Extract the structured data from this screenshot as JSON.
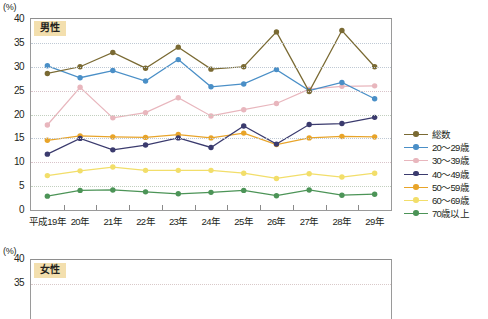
{
  "axis": {
    "unit_label": "(%)",
    "y_ticks": [
      "40",
      "35",
      "30",
      "25",
      "20",
      "15",
      "10",
      "5",
      "0"
    ],
    "y_ticks_chart2": [
      "40",
      "35"
    ],
    "x_labels": [
      "平成19年",
      "20年",
      "21年",
      "22年",
      "23年",
      "24年",
      "25年",
      "26年",
      "27年",
      "28年",
      "29年"
    ]
  },
  "panels": {
    "male_badge": "男性",
    "female_badge": "女性"
  },
  "legend": {
    "items": [
      {
        "label": "総数",
        "color": "#7a6a33"
      },
      {
        "label": "20〜29歳",
        "color": "#4a8fc7"
      },
      {
        "label": "30〜39歳",
        "color": "#e8b6bd"
      },
      {
        "label": "40〜49歳",
        "color": "#3b3b6e"
      },
      {
        "label": "50〜59歳",
        "color": "#e8a429"
      },
      {
        "label": "60〜69歳",
        "color": "#f2de6a"
      },
      {
        "label": "70歳以上",
        "color": "#4c9457"
      }
    ]
  },
  "chart_data": {
    "type": "line",
    "title": "男性",
    "xlabel": "",
    "ylabel": "(%)",
    "ylim": [
      0,
      40
    ],
    "ytick_step": 5,
    "grid": true,
    "legend_position": "right",
    "categories": [
      "平成19年",
      "20年",
      "21年",
      "22年",
      "23年",
      "24年",
      "25年",
      "26年",
      "27年",
      "28年",
      "29年"
    ],
    "series": [
      {
        "name": "総数",
        "color": "#7a6a33",
        "values": [
          28.6,
          30.0,
          33.0,
          29.7,
          34.1,
          29.5,
          30.0,
          37.3,
          24.8,
          37.6,
          30.0
        ]
      },
      {
        "name": "20〜29歳",
        "color": "#4a8fc7",
        "values": [
          30.2,
          27.7,
          29.2,
          27.0,
          31.5,
          25.8,
          26.4,
          29.4,
          25.0,
          26.7,
          23.3
        ]
      },
      {
        "name": "30〜39歳",
        "color": "#e8b6bd",
        "values": [
          17.8,
          25.7,
          19.3,
          20.4,
          23.5,
          19.7,
          21.0,
          22.3,
          25.3,
          25.9,
          26.0
        ]
      },
      {
        "name": "40〜49歳",
        "color": "#3b3b6e",
        "values": [
          11.7,
          15.0,
          12.6,
          13.6,
          15.1,
          13.1,
          17.6,
          13.8,
          17.9,
          18.1,
          19.4
        ]
      },
      {
        "name": "50〜59歳",
        "color": "#e8a429",
        "values": [
          14.6,
          15.5,
          15.3,
          15.2,
          15.8,
          15.1,
          16.1,
          13.7,
          15.1,
          15.4,
          15.3
        ]
      },
      {
        "name": "60〜69歳",
        "color": "#f2de6a",
        "values": [
          7.2,
          8.2,
          9.0,
          8.3,
          8.3,
          8.3,
          7.7,
          6.6,
          7.6,
          6.9,
          7.7
        ]
      },
      {
        "name": "70歳以上",
        "color": "#4c9457",
        "values": [
          2.9,
          4.1,
          4.2,
          3.8,
          3.4,
          3.7,
          4.1,
          3.0,
          4.2,
          3.1,
          3.3
        ]
      }
    ],
    "chart2": {
      "title": "女性",
      "ylim": [
        0,
        40
      ],
      "note": "second panel truncated at bottom of screenshot"
    }
  }
}
